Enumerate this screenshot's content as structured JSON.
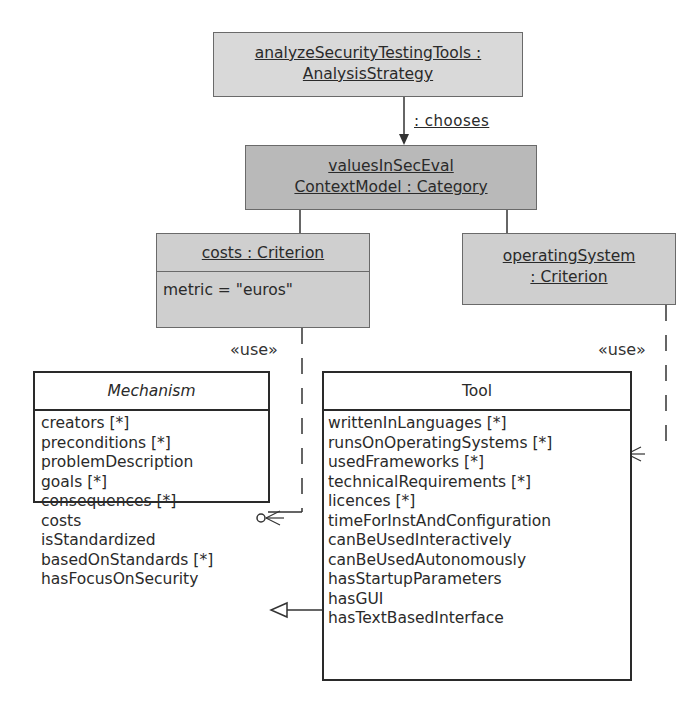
{
  "objects": {
    "analysis_strategy": {
      "line1": "analyzeSecurityTestingTools :",
      "line2": "AnalysisStrategy"
    },
    "category": {
      "line1": "valuesInSecEval",
      "line2": "ContextModel  : Category"
    },
    "costs_criterion": {
      "title": "costs : Criterion",
      "slot": "metric = \"euros\""
    },
    "os_criterion": {
      "line1": "operatingSystem",
      "line2": ": Criterion"
    }
  },
  "links": {
    "chooses_label": ": chooses",
    "use_left_label": "«use»",
    "use_right_label": "«use»"
  },
  "classes": {
    "mechanism": {
      "name": "Mechanism",
      "abstract": true,
      "attributes": [
        "creators [*]",
        "preconditions [*]",
        "problemDescription",
        "goals [*]",
        "consequences [*]",
        "costs",
        "isStandardized",
        "basedOnStandards [*]",
        "hasFocusOnSecurity"
      ]
    },
    "tool": {
      "name": "Tool",
      "abstract": false,
      "attributes": [
        "writtenInLanguages [*]",
        "runsOnOperatingSystems [*]",
        "usedFrameworks [*]",
        "technicalRequirements [*]",
        "licences [*]",
        "timeForInstAndConfiguration",
        "canBeUsedInteractively",
        "canBeUsedAutonomously",
        "hasStartupParameters",
        "hasGUI",
        "hasTextBasedInterface"
      ]
    }
  },
  "colors": {
    "object_light": "#d9d9d9",
    "object_dark": "#b9b9b9",
    "line": "#2a2a2a"
  }
}
